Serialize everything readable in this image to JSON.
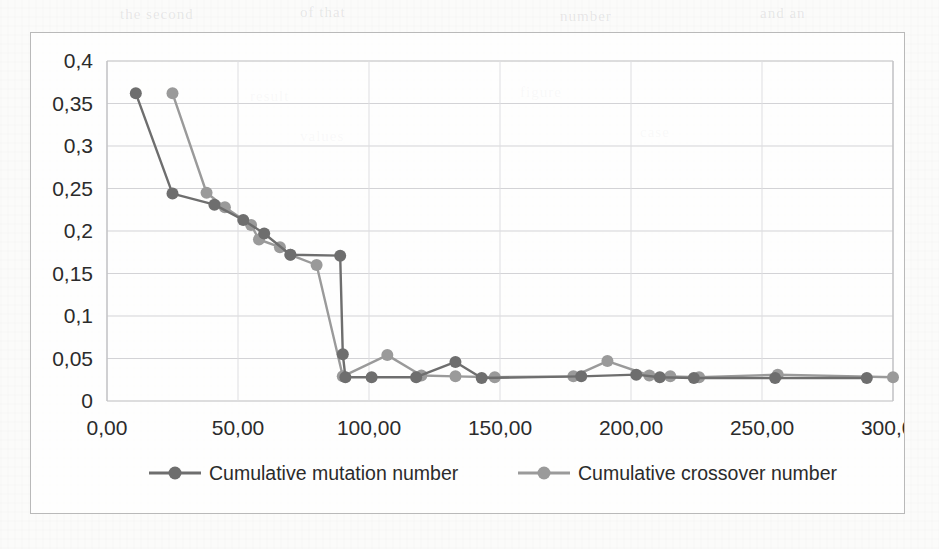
{
  "page": {
    "background_color": "#fbfbfa",
    "frame_border_color": "#b9b9b9",
    "scan_bleed_text": [
      "the second",
      "of that",
      "number",
      "and an",
      "result",
      "figure",
      "values",
      "case"
    ]
  },
  "chart_data": {
    "type": "line",
    "title": "",
    "subtitle": "",
    "xlabel": "",
    "ylabel": "",
    "xlim": [
      0,
      300
    ],
    "ylim": [
      0,
      0.4
    ],
    "grid": true,
    "grid_axis": "y",
    "legend_position": "bottom",
    "decimal_separator": ",",
    "x_tick_labels": [
      "0,00",
      "50,00",
      "100,00",
      "150,00",
      "200,00",
      "250,00",
      "300,00"
    ],
    "x_ticks": [
      0,
      50,
      100,
      150,
      200,
      250,
      300
    ],
    "y_tick_labels": [
      "0",
      "0,05",
      "0,1",
      "0,15",
      "0,2",
      "0,25",
      "0,3",
      "0,35",
      "0,4"
    ],
    "y_ticks": [
      0,
      0.05,
      0.1,
      0.15,
      0.2,
      0.25,
      0.3,
      0.35,
      0.4
    ],
    "series": [
      {
        "name": "Cumulative mutation number",
        "color": "#6e6e6e",
        "marker": "circle",
        "marker_size": 9,
        "line_width": 2.4,
        "points": [
          [
            11,
            0.362
          ],
          [
            25,
            0.244
          ],
          [
            41,
            0.231
          ],
          [
            52,
            0.213
          ],
          [
            60,
            0.197
          ],
          [
            70,
            0.172
          ],
          [
            89,
            0.171
          ],
          [
            90,
            0.055
          ],
          [
            91,
            0.028
          ],
          [
            101,
            0.028
          ],
          [
            118,
            0.028
          ],
          [
            133,
            0.046
          ],
          [
            143,
            0.027
          ],
          [
            181,
            0.029
          ],
          [
            202,
            0.031
          ],
          [
            211,
            0.028
          ],
          [
            224,
            0.027
          ],
          [
            255,
            0.027
          ],
          [
            290,
            0.027
          ]
        ]
      },
      {
        "name": "Cumulative crossover number",
        "color": "#9a9a9a",
        "marker": "circle",
        "marker_size": 9,
        "line_width": 2.4,
        "points": [
          [
            25,
            0.362
          ],
          [
            38,
            0.245
          ],
          [
            45,
            0.228
          ],
          [
            55,
            0.207
          ],
          [
            58,
            0.19
          ],
          [
            66,
            0.181
          ],
          [
            70,
            0.172
          ],
          [
            80,
            0.16
          ],
          [
            90,
            0.029
          ],
          [
            107,
            0.054
          ],
          [
            120,
            0.03
          ],
          [
            133,
            0.029
          ],
          [
            148,
            0.028
          ],
          [
            178,
            0.029
          ],
          [
            191,
            0.047
          ],
          [
            207,
            0.03
          ],
          [
            215,
            0.029
          ],
          [
            226,
            0.028
          ],
          [
            256,
            0.031
          ],
          [
            300,
            0.028
          ]
        ]
      }
    ],
    "legend": [
      {
        "label": "Cumulative mutation number",
        "color": "#6e6e6e"
      },
      {
        "label": "Cumulative crossover number",
        "color": "#9a9a9a"
      }
    ]
  }
}
